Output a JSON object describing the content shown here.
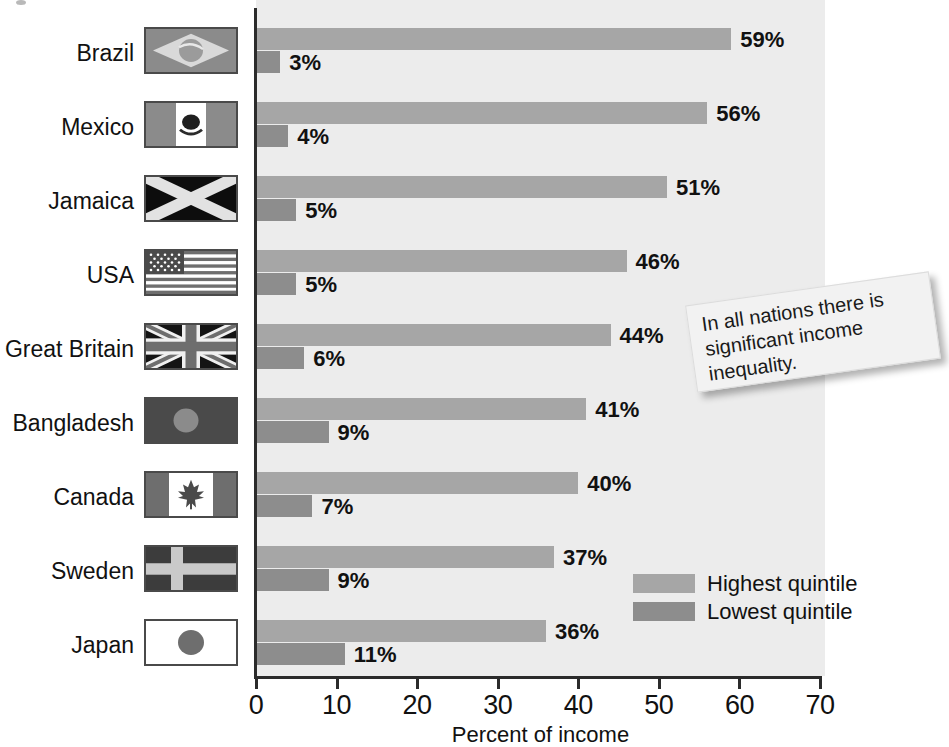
{
  "chart_data": {
    "type": "bar",
    "orientation": "horizontal",
    "title": "",
    "xlabel": "Percent of income",
    "ylabel": "",
    "xlim": [
      0,
      70
    ],
    "xticks": [
      0,
      10,
      20,
      30,
      40,
      50,
      60,
      70
    ],
    "xtick_labels": [
      "0",
      "10",
      "20",
      "30",
      "40",
      "50",
      "60",
      "70"
    ],
    "grid": false,
    "legend_position": "inside-right-lower",
    "categories": [
      "Brazil",
      "Mexico",
      "Jamaica",
      "USA",
      "Great Britain",
      "Bangladesh",
      "Canada",
      "Sweden",
      "Japan"
    ],
    "series": [
      {
        "name": "Highest quintile",
        "color": "#a6a6a6",
        "values": [
          59,
          56,
          51,
          46,
          44,
          41,
          40,
          37,
          36
        ],
        "labels": [
          "59%",
          "56%",
          "51%",
          "46%",
          "44%",
          "41%",
          "40%",
          "37%",
          "36%"
        ]
      },
      {
        "name": "Lowest quintile",
        "color": "#8d8d8d",
        "values": [
          3,
          4,
          5,
          5,
          6,
          9,
          7,
          9,
          11
        ],
        "labels": [
          "3%",
          "4%",
          "5%",
          "5%",
          "6%",
          "9%",
          "7%",
          "9%",
          "11%"
        ]
      }
    ],
    "annotations": [
      "In all nations there is significant income inequality."
    ]
  },
  "axis": {
    "x_title": "Percent of income",
    "ticks": [
      {
        "value": 0,
        "label": "0"
      },
      {
        "value": 10,
        "label": "10"
      },
      {
        "value": 20,
        "label": "20"
      },
      {
        "value": 30,
        "label": "30"
      },
      {
        "value": 40,
        "label": "40"
      },
      {
        "value": 50,
        "label": "50"
      },
      {
        "value": 60,
        "label": "60"
      },
      {
        "value": 70,
        "label": "70"
      }
    ]
  },
  "rows": [
    {
      "country": "Brazil",
      "flag": "flag-brazil",
      "high_value": 59,
      "high_label": "59%",
      "low_value": 3,
      "low_label": "3%"
    },
    {
      "country": "Mexico",
      "flag": "flag-mexico",
      "high_value": 56,
      "high_label": "56%",
      "low_value": 4,
      "low_label": "4%"
    },
    {
      "country": "Jamaica",
      "flag": "flag-jamaica",
      "high_value": 51,
      "high_label": "51%",
      "low_value": 5,
      "low_label": "5%"
    },
    {
      "country": "USA",
      "flag": "flag-usa",
      "high_value": 46,
      "high_label": "46%",
      "low_value": 5,
      "low_label": "5%"
    },
    {
      "country": "Great Britain",
      "flag": "flag-great-britain",
      "high_value": 44,
      "high_label": "44%",
      "low_value": 6,
      "low_label": "6%"
    },
    {
      "country": "Bangladesh",
      "flag": "flag-bangladesh",
      "high_value": 41,
      "high_label": "41%",
      "low_value": 9,
      "low_label": "9%"
    },
    {
      "country": "Canada",
      "flag": "flag-canada",
      "high_value": 40,
      "high_label": "40%",
      "low_value": 7,
      "low_label": "7%"
    },
    {
      "country": "Sweden",
      "flag": "flag-sweden",
      "high_value": 37,
      "high_label": "37%",
      "low_value": 9,
      "low_label": "9%"
    },
    {
      "country": "Japan",
      "flag": "flag-japan",
      "high_value": 36,
      "high_label": "36%",
      "low_value": 11,
      "low_label": "11%"
    }
  ],
  "legend": {
    "items": [
      {
        "label": "Highest quintile",
        "color": "#a6a6a6"
      },
      {
        "label": "Lowest quintile",
        "color": "#8d8d8d"
      }
    ]
  },
  "callout": {
    "text": "In all nations there is significant income inequality."
  },
  "colors": {
    "plot_background": "#ececec",
    "page_background": "#ffffff",
    "axis": "#2b2b2b",
    "highest_quintile": "#a6a6a6",
    "lowest_quintile": "#8d8d8d",
    "text": "#111111",
    "callout_background": "#f2f2f2"
  }
}
